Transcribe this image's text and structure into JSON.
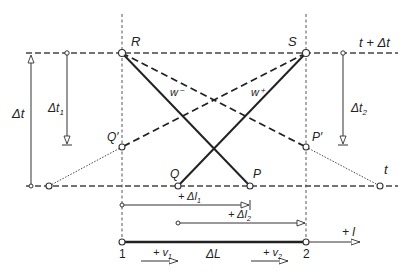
{
  "diagram": {
    "time_axes": {
      "top_label": "t + Δt",
      "bottom_label": "t"
    },
    "points": {
      "R": "R",
      "S": "S",
      "Q": "Q",
      "P": "P",
      "Q_prime": "Q′",
      "P_prime": "P′"
    },
    "characteristics": {
      "w_minus": "w⁻",
      "w_plus": "w⁺"
    },
    "intervals": {
      "dt": "Δt",
      "dt1": "Δt",
      "dt1_sub": "1",
      "dt2": "Δt",
      "dt2_sub": "2",
      "dl1": "+ Δl",
      "dl1_sub": "1",
      "dl2": "+ Δl",
      "dl2_sub": "2",
      "dL": "ΔL"
    },
    "sections": {
      "section1": "1",
      "section2": "2"
    },
    "velocities": {
      "v1": "+ v",
      "v1_sub": "1",
      "v2": "+ v",
      "v2_sub": "2"
    },
    "axis_l": "+ l"
  }
}
